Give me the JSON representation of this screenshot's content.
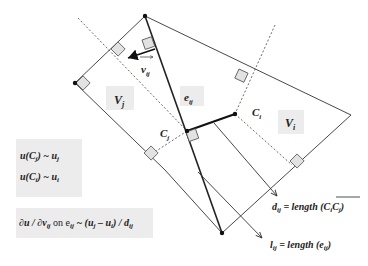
{
  "diagram": {
    "labels": {
      "v_ij": "v",
      "v_ij_sub": "ij",
      "e_ij": "e",
      "e_ij_sub": "ij",
      "V_j": "V",
      "V_j_sub": "j",
      "V_i": "V",
      "V_i_sub": "i",
      "C_i": "C",
      "C_i_sub": "i",
      "C_j": "C",
      "C_j_sub": "j"
    },
    "equations": {
      "u_cj": "u(C",
      "u_cj_sub": "j",
      "u_cj_rest": ") ~ u",
      "u_cj_rest_sub": "j",
      "u_ci": "u(C",
      "u_ci_sub": "i",
      "u_ci_rest": ") ~ u",
      "u_ci_rest_sub": "i",
      "gradient": "∂u / ∂v",
      "gradient_sub1": "ij",
      "gradient_on": " on e",
      "gradient_sub2": "ij",
      "gradient_approx": " ~ (u",
      "gradient_sub3": "j",
      "gradient_minus": " – u",
      "gradient_sub4": "i",
      "gradient_end": ") / d",
      "gradient_sub5": "ij"
    },
    "annotations": {
      "d_ij": "d",
      "d_ij_sub": "ij",
      "d_ij_eq": " = length (",
      "d_ij_seg": "C",
      "d_ij_seg_sub1": "i",
      "d_ij_seg2": "C",
      "d_ij_seg_sub2": "j",
      "d_ij_close": ")",
      "l_ij": "l",
      "l_ij_sub": "ij",
      "l_ij_eq": " = length (e",
      "l_ij_eq_sub": "ij",
      "l_ij_close": ")"
    },
    "colors": {
      "line": "#333333",
      "label_bg": "#ececec",
      "square_fill": "#e2e2e2"
    }
  }
}
